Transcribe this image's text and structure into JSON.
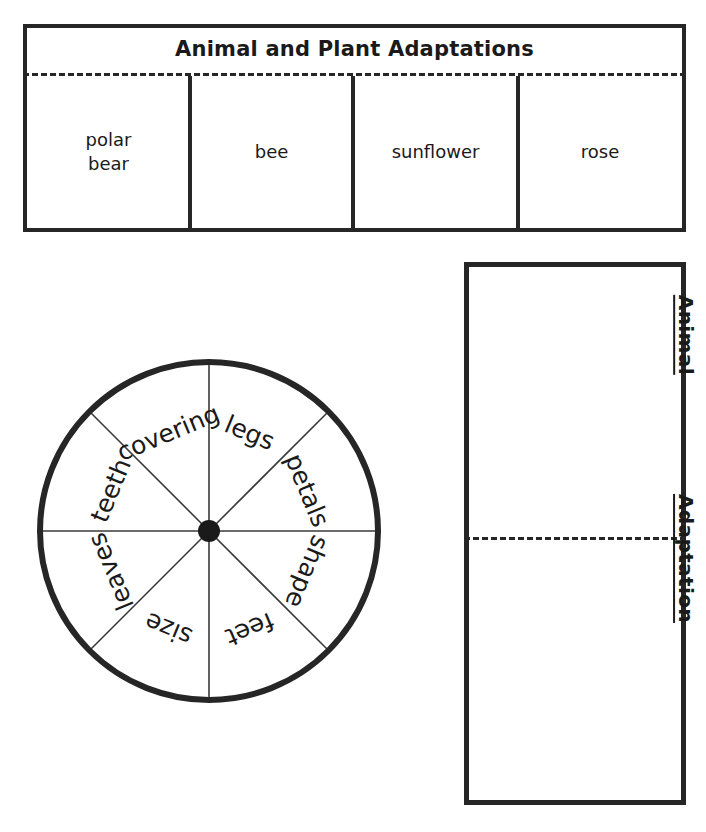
{
  "worksheet": {
    "top_foldable": {
      "title": "Animal and Plant Adaptations",
      "columns": [
        {
          "label": "polar\nbear"
        },
        {
          "label": "bee"
        },
        {
          "label": "sunflower"
        },
        {
          "label": "rose"
        }
      ]
    },
    "spinner": {
      "hub_color": "#1a1a1a",
      "rim_color": "#262626",
      "segments": [
        {
          "label": "legs"
        },
        {
          "label": "petals"
        },
        {
          "label": "shape"
        },
        {
          "label": "feet"
        },
        {
          "label": "size"
        },
        {
          "label": "leaves"
        },
        {
          "label": "teeth"
        },
        {
          "label": "covering"
        }
      ]
    },
    "right_foldable": {
      "top_label": "Animal",
      "bottom_label": "Adaptation"
    }
  }
}
